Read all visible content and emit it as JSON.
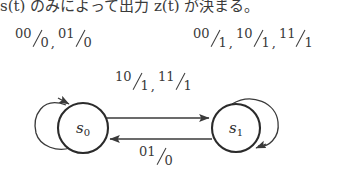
{
  "caption": {
    "text_before": "s(t) のみによって出力 z(t) が決まる。",
    "full": "s(t) のみによって出力 z(t) が決まる。"
  },
  "diagram": {
    "type": "finite-state-machine",
    "kind": "mealy-machine-state-transition-diagram",
    "ink_color": "#3a3a3a",
    "background": "#ffffff",
    "states": [
      {
        "id": "s0",
        "label_base": "s",
        "label_sub": "0",
        "cx": 83,
        "cy": 128,
        "r": 25
      },
      {
        "id": "s1",
        "label_base": "s",
        "label_sub": "1",
        "cx": 236,
        "cy": 128,
        "r": 24
      }
    ],
    "transitions": [
      {
        "id": "loop-s0",
        "from": "s0",
        "to": "s0",
        "shape": "self-loop-upper-left",
        "label_text": "00/0, 01/0",
        "terms": [
          {
            "input": "00",
            "output": "0"
          },
          {
            "input": "01",
            "output": "0"
          }
        ]
      },
      {
        "id": "edge-s0-s1",
        "from": "s0",
        "to": "s1",
        "shape": "straight-arrow-right",
        "label_text": "10/1, 11/1",
        "terms": [
          {
            "input": "10",
            "output": "1"
          },
          {
            "input": "11",
            "output": "1"
          }
        ]
      },
      {
        "id": "edge-s1-s0",
        "from": "s1",
        "to": "s0",
        "shape": "straight-arrow-left",
        "label_text": "01/0",
        "terms": [
          {
            "input": "01",
            "output": "0"
          }
        ]
      },
      {
        "id": "loop-s1",
        "from": "s1",
        "to": "s1",
        "shape": "self-loop-upper-right",
        "label_text": "00/1, 10/1, 11/1",
        "terms": [
          {
            "input": "00",
            "output": "1"
          },
          {
            "input": "10",
            "output": "1"
          },
          {
            "input": "11",
            "output": "1"
          }
        ]
      }
    ]
  }
}
